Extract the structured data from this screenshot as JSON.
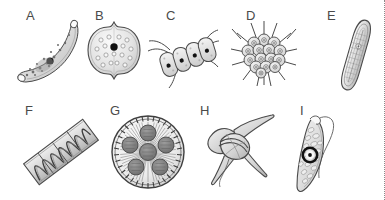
{
  "figure": {
    "background_color": "#ffffff",
    "border": {
      "side": "right",
      "style": "dotted",
      "color": "#8a8a8a"
    },
    "rows": 2,
    "columns_top": 5,
    "columns_bottom": 4,
    "line_color": "#4a4a4a",
    "fill_light": "#e6e6e6",
    "fill_mid": "#c9c9c9",
    "fill_dark": "#7d7d7d",
    "accent_dark": "#1a1a1a"
  },
  "panels": [
    {
      "id": "A",
      "label": "A",
      "name": "crescent-cell-specimen",
      "shape": "crescent",
      "description": "elongated curved crescent-shaped cell with tapered pointed ends, granular interior and one large dark central body"
    },
    {
      "id": "B",
      "label": "B",
      "name": "bilobed-cell-specimen",
      "shape": "bilobed-round",
      "description": "rounded bi-lobed cell with notched top and bottom, ring of pale circular granules and a dark central spot"
    },
    {
      "id": "C",
      "label": "C",
      "name": "four-cell-colony-specimen",
      "shape": "linear-colony",
      "description": "linear colony of four oblong cells joined side by side, each with a dark nucleus, outer cells bearing long curved spines"
    },
    {
      "id": "D",
      "label": "D",
      "name": "spiny-colony-specimen",
      "shape": "radial-colony",
      "description": "rounded colony of many small circular cells, each with a ringed center, with spines radiating outward from the margin"
    },
    {
      "id": "E",
      "label": "E",
      "name": "elongate-diatom-specimen",
      "shape": "elongate-spindle",
      "description": "long narrow spindle-shaped cell with rounded ends, double outline and fine transverse striations, tilted diagonally"
    },
    {
      "id": "F",
      "label": "F",
      "name": "filament-spiral-specimen",
      "shape": "rectangular-filament",
      "description": "diagonal rectangular filament divided by cross walls, containing a helical ribbon-shaped band running its length"
    },
    {
      "id": "G",
      "label": "G",
      "name": "radial-disc-specimen",
      "shape": "circular-disc",
      "description": "circular disc with finely toothed margin, dense radiating striae, and several darker rounded internal patches around a central body"
    },
    {
      "id": "H",
      "label": "H",
      "name": "horned-dinoflagellate-specimen",
      "shape": "three-horned",
      "description": "angular cell with a long tapering apical horn and two curved posterior horns, crossed by a transverse girdle groove and a trailing flagellum"
    },
    {
      "id": "I",
      "label": "I",
      "name": "flagellate-spindle-specimen",
      "shape": "spindle-flagellate",
      "description": "elongate spindle-shaped flagellate cell packed with oval granules, a prominent dark ring-shaped body, and a long flagellum emerging from the anterior end"
    }
  ]
}
